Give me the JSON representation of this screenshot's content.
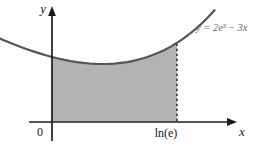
{
  "figure": {
    "axis_labels": {
      "x": "x",
      "y": "y"
    },
    "origin_label": "0",
    "x_tick_label": "ln(e)",
    "equation": {
      "lead": "y = 2e",
      "sup": "x",
      "tail": "− 3x"
    }
  },
  "colors": {
    "region_fill": "#b3b3b3",
    "curve_stroke": "#555555",
    "axis": "#1c1c1c",
    "equation_text": "#6f6f6f",
    "background": "#fdfdfd"
  },
  "chart_data": {
    "type": "area",
    "function": "y = 2e^x − 3x",
    "x_range": [
      -0.42,
      1.3
    ],
    "shade_interval": [
      0,
      1
    ],
    "shade_interval_labels": [
      "0",
      "ln(e)"
    ],
    "curve_label": "y = 2e^x − 3x",
    "grid": false,
    "points": [
      [
        -0.42,
        2.574
      ],
      [
        -0.4,
        2.541
      ],
      [
        -0.35,
        2.459
      ],
      [
        -0.3,
        2.382
      ],
      [
        -0.25,
        2.308
      ],
      [
        -0.2,
        2.237
      ],
      [
        -0.15,
        2.171
      ],
      [
        -0.1,
        2.11
      ],
      [
        -0.05,
        2.052
      ],
      [
        0.0,
        2.0
      ],
      [
        0.05,
        1.953
      ],
      [
        0.1,
        1.91
      ],
      [
        0.15,
        1.874
      ],
      [
        0.2,
        1.843
      ],
      [
        0.25,
        1.818
      ],
      [
        0.3,
        1.8
      ],
      [
        0.35,
        1.788
      ],
      [
        0.4,
        1.784
      ],
      [
        0.45,
        1.787
      ],
      [
        0.5,
        1.797
      ],
      [
        0.55,
        1.817
      ],
      [
        0.6,
        1.844
      ],
      [
        0.65,
        1.881
      ],
      [
        0.7,
        1.928
      ],
      [
        0.75,
        1.984
      ],
      [
        0.8,
        2.051
      ],
      [
        0.85,
        2.129
      ],
      [
        0.9,
        2.219
      ],
      [
        0.95,
        2.321
      ],
      [
        1.0,
        2.437
      ],
      [
        1.05,
        2.565
      ],
      [
        1.1,
        2.708
      ],
      [
        1.15,
        2.866
      ],
      [
        1.2,
        3.04
      ],
      [
        1.25,
        3.231
      ],
      [
        1.3,
        3.439
      ]
    ],
    "mapping": {
      "origin_px": [
        52,
        122
      ],
      "px_per_unit_x": 125,
      "px_per_unit_y": 32.5
    }
  }
}
